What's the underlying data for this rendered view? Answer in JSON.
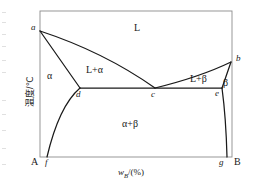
{
  "figure": {
    "kind": "binary-eutectic-phase-diagram",
    "axes": {
      "x_title_var": "w",
      "x_title_sub": "B",
      "x_title_rest": "/(%)",
      "x_title_full": "wB/(%)",
      "y_title": "温度/℃",
      "frame": {
        "left": 40,
        "right": 232,
        "top": 11,
        "bottom": 157
      },
      "grid": false
    },
    "colors": {
      "curve": "#1a1a1a",
      "frame": "#8c8c8c",
      "text": "#1a1a1a",
      "background": "#ffffff"
    },
    "regions": [
      {
        "id": "liquid",
        "label": "L",
        "x": 138,
        "y": 28
      },
      {
        "id": "liquid-alpha",
        "label": "L+α",
        "x": 94,
        "y": 71
      },
      {
        "id": "liquid-beta",
        "label": "L+β",
        "x": 196,
        "y": 80
      },
      {
        "id": "alpha",
        "label": "α",
        "x": 50,
        "y": 77
      },
      {
        "id": "beta",
        "label": "β",
        "x": 225,
        "y": 84
      },
      {
        "id": "alpha-beta",
        "label": "α+β",
        "x": 130,
        "y": 125
      }
    ],
    "points": [
      {
        "id": "a",
        "label": "a",
        "x": 40,
        "y": 31,
        "lx": 31,
        "ly": 23,
        "desc": "melting point of A"
      },
      {
        "id": "b",
        "label": "b",
        "x": 231,
        "y": 62,
        "lx": 236,
        "ly": 54,
        "desc": "melting point of B"
      },
      {
        "id": "c",
        "label": "c",
        "x": 155,
        "y": 88,
        "lx": 151,
        "ly": 90,
        "desc": "eutectic point"
      },
      {
        "id": "d",
        "label": "d",
        "x": 80,
        "y": 88,
        "lx": 76,
        "ly": 90,
        "desc": "alpha solubility limit at eutectic"
      },
      {
        "id": "e",
        "label": "e",
        "x": 222,
        "y": 88,
        "lx": 215,
        "ly": 90,
        "desc": "beta solubility limit at eutectic"
      },
      {
        "id": "f",
        "label": "f",
        "x": 47,
        "y": 157,
        "lx": 45,
        "ly": 158,
        "desc": "alpha solvus at base"
      },
      {
        "id": "g",
        "label": "g",
        "x": 227,
        "y": 157,
        "lx": 220,
        "ly": 158,
        "desc": "beta solvus at base"
      }
    ],
    "end_labels": [
      {
        "id": "A",
        "label": "A",
        "x": 31,
        "y": 158
      },
      {
        "id": "B",
        "label": "B",
        "x": 236,
        "y": 158
      }
    ],
    "curves": [
      {
        "id": "liquidus-a-c",
        "name": "liquidus A side",
        "path": "M 40 31 Q 104 52 155 88"
      },
      {
        "id": "liquidus-b-c",
        "name": "liquidus B side",
        "path": "M 155 88 Q 200 77 231 62"
      },
      {
        "id": "solidus-a-d",
        "name": "solidus A side",
        "path": "M 40 31 L 80 88"
      },
      {
        "id": "solidus-b-e",
        "name": "solidus B side",
        "path": "M 231 62 L 222 88"
      },
      {
        "id": "eutectic-line",
        "name": "eutectic horizontal d-c-e",
        "path": "M 80 88 L 222 88"
      },
      {
        "id": "solvus-d-f",
        "name": "alpha solvus d to f",
        "path": "M 80 88 Q 59 106 47 157"
      },
      {
        "id": "solvus-e-g",
        "name": "beta solvus e to g",
        "path": "M 222 88 Q 226 118 227 157"
      }
    ]
  },
  "chart_data": {
    "type": "line",
    "xlabel": "wB/(%)",
    "ylabel": "温度/℃",
    "grid": false,
    "legend": "none",
    "xlim": [
      0,
      100
    ],
    "ylim": [
      0,
      100
    ],
    "annotations": [
      "L",
      "L+α",
      "L+β",
      "α",
      "β",
      "α+β",
      "a",
      "b",
      "c",
      "d",
      "e",
      "f",
      "g",
      "A",
      "B"
    ],
    "series": [
      {
        "name": "liquidus (A side, a→c)",
        "x": [
          0,
          20,
          40,
          60
        ],
        "y": [
          86,
          72,
          62,
          47
        ]
      },
      {
        "name": "liquidus (B side, c→b)",
        "x": [
          60,
          75,
          90,
          100
        ],
        "y": [
          47,
          54,
          61,
          65
        ]
      },
      {
        "name": "solidus (A side, a→d)",
        "x": [
          0,
          10,
          21
        ],
        "y": [
          86,
          67,
          47
        ]
      },
      {
        "name": "solidus (B side, b→e)",
        "x": [
          100,
          97,
          95
        ],
        "y": [
          65,
          55,
          47
        ]
      },
      {
        "name": "eutectic isotherm (d–c–e)",
        "x": [
          21,
          60,
          95
        ],
        "y": [
          47,
          47,
          47
        ]
      },
      {
        "name": "solvus (α, d→f)",
        "x": [
          21,
          13,
          4
        ],
        "y": [
          47,
          30,
          0
        ]
      },
      {
        "name": "solvus (β, e→g)",
        "x": [
          95,
          97,
          97
        ],
        "y": [
          47,
          25,
          0
        ]
      }
    ]
  }
}
